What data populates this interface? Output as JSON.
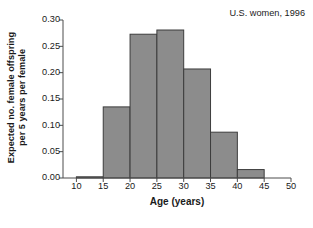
{
  "chart_data": {
    "type": "bar",
    "title": "",
    "subtitle": "",
    "annotation": "U.S. women, 1996",
    "xlabel": "Age (years)",
    "ylabel_line1": "Expected no. female offspring",
    "ylabel_line2": "per 5 years per female",
    "xlim": [
      7.5,
      50
    ],
    "ylim": [
      0.0,
      0.3
    ],
    "grid": false,
    "legend": null,
    "bin_width": 5,
    "xticks": [
      10,
      15,
      20,
      25,
      30,
      35,
      40,
      45,
      50
    ],
    "xtick_labels": [
      "10",
      "15",
      "20",
      "25",
      "30",
      "35",
      "40",
      "45",
      "50"
    ],
    "yticks": [
      0.0,
      0.05,
      0.1,
      0.15,
      0.2,
      0.25,
      0.3
    ],
    "ytick_labels": [
      "0.00",
      "0.05",
      "0.10",
      "0.15",
      "0.20",
      "0.25",
      "0.30"
    ],
    "bin_starts": [
      10,
      15,
      20,
      25,
      30,
      35,
      40
    ],
    "bin_ends": [
      15,
      20,
      25,
      30,
      35,
      40,
      45
    ],
    "categories": [
      "10-15",
      "15-20",
      "20-25",
      "25-30",
      "30-35",
      "35-40",
      "40-45"
    ],
    "values": [
      0.001,
      0.135,
      0.273,
      0.281,
      0.207,
      0.087,
      0.016
    ],
    "bar_fill": "#8c8c8c",
    "bar_stroke": "#3c3c3c",
    "axis_color": "#4d4d4d",
    "text_color": "#1a1a1a"
  }
}
